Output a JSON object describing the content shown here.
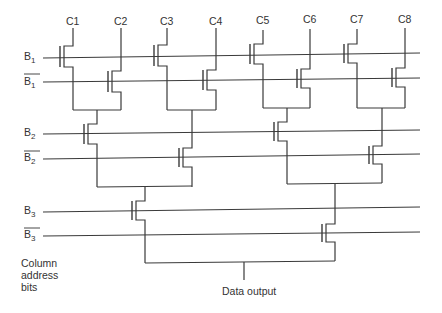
{
  "diagram": {
    "type": "column multiplexer tree decoder",
    "column_labels": [
      "C1",
      "C2",
      "C3",
      "C4",
      "C5",
      "C6",
      "C7",
      "C8"
    ],
    "address_lines": [
      {
        "name": "B",
        "sub": "1",
        "complement": false
      },
      {
        "name": "B",
        "sub": "1",
        "complement": true
      },
      {
        "name": "B",
        "sub": "2",
        "complement": false
      },
      {
        "name": "B",
        "sub": "2",
        "complement": true
      },
      {
        "name": "B",
        "sub": "3",
        "complement": false
      },
      {
        "name": "B",
        "sub": "3",
        "complement": true
      }
    ],
    "side_label_lines": [
      "Column",
      "address",
      "bits"
    ],
    "output_label": "Data output",
    "line_color": "#3a3a3a"
  }
}
